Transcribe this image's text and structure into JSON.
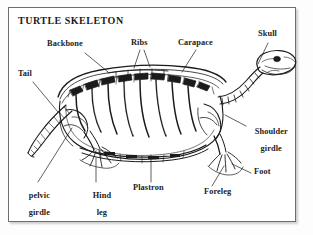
{
  "figure": {
    "title": "TURTLE SKELETON",
    "ink_color": "#1b1b1b",
    "frame_color": "#6e6e6e",
    "background_color": "#ffffff"
  },
  "labels": [
    {
      "id": "backbone",
      "text": "Backbone",
      "text2": ""
    },
    {
      "id": "ribs",
      "text": "Ribs",
      "text2": ""
    },
    {
      "id": "carapace",
      "text": "Carapace",
      "text2": ""
    },
    {
      "id": "skull",
      "text": "Skull",
      "text2": ""
    },
    {
      "id": "tail",
      "text": "Tail",
      "text2": ""
    },
    {
      "id": "shoulder-girdle",
      "text": "Shoulder",
      "text2": "girdle"
    },
    {
      "id": "foot",
      "text": "Foot",
      "text2": ""
    },
    {
      "id": "foreleg",
      "text": "Foreleg",
      "text2": ""
    },
    {
      "id": "plastron",
      "text": "Plastron",
      "text2": ""
    },
    {
      "id": "hind-leg",
      "text": "Hind",
      "text2": "leg"
    },
    {
      "id": "pelvic-girdle",
      "text": "pelvic",
      "text2": "girdle"
    }
  ]
}
